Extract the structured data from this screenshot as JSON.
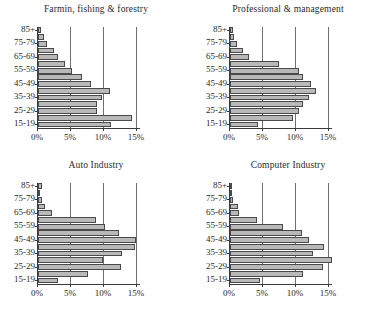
{
  "figure": {
    "panel_count": 4,
    "layout": "2x2"
  },
  "axis": {
    "x_tick_labels": [
      "0%",
      "5%",
      "10%",
      "15%"
    ],
    "x_tick_values": [
      0,
      5,
      10,
      15
    ],
    "y_tick_labels": [
      "85+",
      "75-79",
      "65-69",
      "55-59",
      "45-49",
      "35-39",
      "25-29",
      "15-19"
    ],
    "age_groups": [
      "15-19",
      "20-24",
      "25-29",
      "30-34",
      "35-39",
      "40-44",
      "45-49",
      "50-54",
      "55-59",
      "60-64",
      "65-69",
      "70-74",
      "75-79",
      "80-84",
      "85+"
    ]
  },
  "colors": {
    "bar_fill": "#b9b9b9",
    "bar_stroke": "#4a4a4a",
    "gridline": "#6f6f6f",
    "axis": "#3a3a3a",
    "text": "#2a2a2a",
    "background": "#ffffff"
  },
  "chart_data": [
    {
      "type": "bar",
      "orientation": "horizontal",
      "title": "Farmin, fishing & forestry",
      "xlabel": "",
      "ylabel": "",
      "xlim": [
        0,
        15
      ],
      "ylim": [
        0,
        15
      ],
      "grid": true,
      "legend": "none",
      "categories": [
        "85+",
        "80-84",
        "75-79",
        "70-74",
        "65-69",
        "60-64",
        "55-59",
        "50-54",
        "45-49",
        "40-44",
        "35-39",
        "30-34",
        "25-29",
        "20-24",
        "15-19"
      ],
      "values": [
        0.5,
        0.9,
        1.4,
        2.4,
        3.1,
        4.1,
        5.2,
        6.6,
        8.1,
        10.9,
        9.7,
        9.0,
        9.0,
        14.3,
        11.0
      ],
      "tick_labels": [
        "0%",
        "5%",
        "10%",
        "15%"
      ]
    },
    {
      "type": "bar",
      "orientation": "horizontal",
      "title": "Professional & management",
      "xlabel": "",
      "ylabel": "",
      "xlim": [
        0,
        15
      ],
      "ylim": [
        0,
        15
      ],
      "grid": true,
      "legend": "none",
      "categories": [
        "85+",
        "80-84",
        "75-79",
        "70-74",
        "65-69",
        "60-64",
        "55-59",
        "50-54",
        "45-49",
        "40-44",
        "35-39",
        "30-34",
        "25-29",
        "20-24",
        "15-19"
      ],
      "values": [
        0.4,
        0.6,
        1.0,
        1.9,
        2.9,
        7.4,
        10.4,
        11.1,
        12.3,
        13.1,
        12.0,
        11.1,
        10.4,
        9.6,
        4.2
      ],
      "tick_labels": [
        "0%",
        "5%",
        "10%",
        "15%"
      ]
    },
    {
      "type": "bar",
      "orientation": "horizontal",
      "title": "Auto Industry",
      "xlabel": "",
      "ylabel": "",
      "xlim": [
        0,
        15
      ],
      "ylim": [
        0,
        15
      ],
      "grid": true,
      "legend": "none",
      "categories": [
        "85+",
        "80-84",
        "75-79",
        "70-74",
        "65-69",
        "60-64",
        "55-59",
        "50-54",
        "45-49",
        "40-44",
        "35-39",
        "30-34",
        "25-29",
        "20-24",
        "15-19"
      ],
      "values": [
        0.6,
        0.3,
        0.6,
        1.0,
        2.1,
        8.8,
        10.2,
        12.2,
        14.8,
        14.7,
        12.8,
        9.9,
        12.6,
        7.5,
        3.1
      ],
      "tick_labels": [
        "0%",
        "5%",
        "10%",
        "15%"
      ]
    },
    {
      "type": "bar",
      "orientation": "horizontal",
      "title": "Computer Industry",
      "xlabel": "",
      "ylabel": "",
      "xlim": [
        0,
        15
      ],
      "ylim": [
        0,
        15
      ],
      "grid": true,
      "legend": "none",
      "categories": [
        "85+",
        "80-84",
        "75-79",
        "70-74",
        "65-69",
        "60-64",
        "55-59",
        "50-54",
        "45-49",
        "40-44",
        "35-39",
        "30-34",
        "25-29",
        "20-24",
        "15-19"
      ],
      "values": [
        0.1,
        0.2,
        0.5,
        1.2,
        1.4,
        4.1,
        8.0,
        10.9,
        11.9,
        14.2,
        12.6,
        15.4,
        14.1,
        11.0,
        4.6
      ],
      "tick_labels": [
        "0%",
        "5%",
        "10%",
        "15%"
      ]
    }
  ]
}
